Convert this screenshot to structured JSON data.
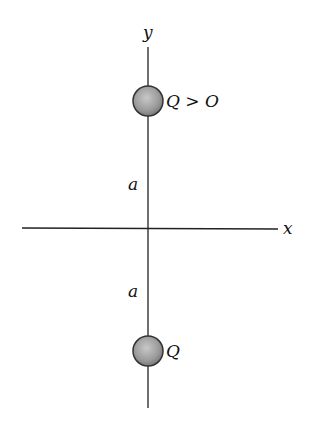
{
  "diagram": {
    "axes": {
      "x_label": "x",
      "y_label": "y"
    },
    "distances": {
      "upper_label": "a",
      "lower_label": "a"
    },
    "charges": [
      {
        "id": "top",
        "label": "Q > O"
      },
      {
        "id": "bottom",
        "label": "Q"
      }
    ],
    "colors": {
      "line": "#222222",
      "charge_fill": "#a8a8a8",
      "charge_edge": "#333333"
    }
  }
}
